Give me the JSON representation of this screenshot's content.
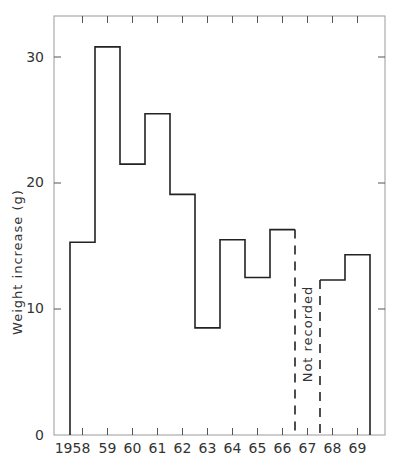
{
  "chart_data": {
    "type": "bar",
    "style": "step-histogram",
    "title": "",
    "xlabel": "",
    "ylabel": "Weight increase (g)",
    "ylim": [
      0,
      32
    ],
    "yticks": [
      0,
      10,
      20,
      30
    ],
    "grid": false,
    "legend": null,
    "categories": [
      "1958",
      "59",
      "60",
      "61",
      "62",
      "63",
      "64",
      "65",
      "66",
      "67",
      "68",
      "69"
    ],
    "years": [
      1958,
      1959,
      1960,
      1961,
      1962,
      1963,
      1964,
      1965,
      1966,
      1967,
      1968,
      1969
    ],
    "values": [
      15.3,
      30.8,
      21.5,
      25.5,
      19.1,
      8.5,
      15.5,
      12.5,
      16.3,
      null,
      12.3,
      14.3
    ],
    "annotations": [
      {
        "text": "Not recorded",
        "category": "67",
        "orientation": "vertical"
      }
    ]
  },
  "labels": {
    "ylabel": "Weight increase (g)",
    "not_recorded": "Not recorded",
    "y0": "0",
    "y10": "10",
    "y20": "20",
    "y30": "30",
    "x": [
      "1958",
      "59",
      "60",
      "61",
      "62",
      "63",
      "64",
      "65",
      "66",
      "67",
      "68",
      "69"
    ]
  }
}
